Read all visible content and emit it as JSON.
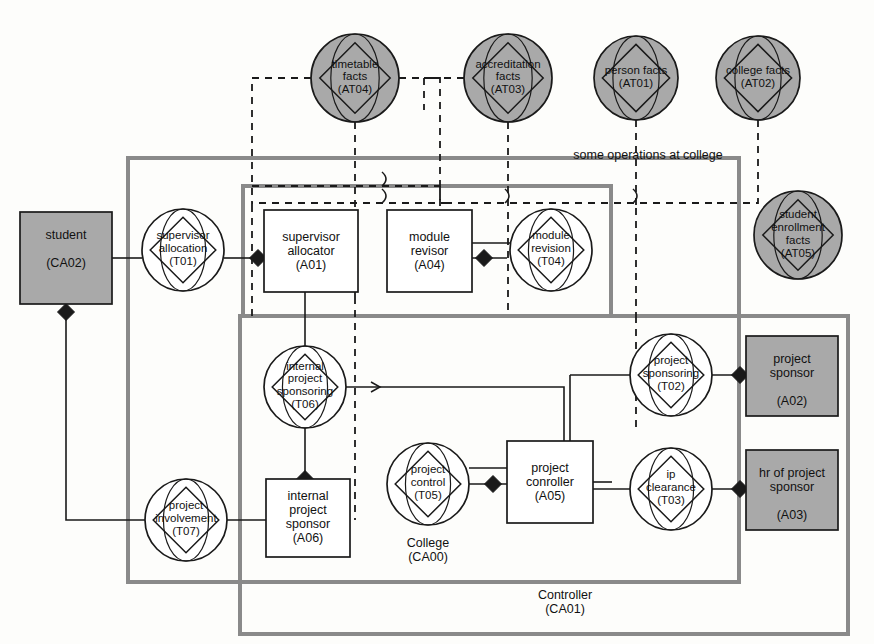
{
  "diagram": {
    "title_note": "some operations at college",
    "colors": {
      "gray_fill": "#a9a9a9",
      "white_fill": "#ffffff",
      "stroke": "#1a1a1a",
      "container_stroke": "#8a8a8a",
      "diamond_fill": "#1a1a1a"
    }
  },
  "fact_nodes": [
    {
      "id": "AT04",
      "name": "timetable\nfacts",
      "code": "(AT04)",
      "cx": 355,
      "cy": 78,
      "r": 44
    },
    {
      "id": "AT03",
      "name": "accreditation\nfacts",
      "code": "(AT03)",
      "cx": 508,
      "cy": 78,
      "r": 44
    },
    {
      "id": "AT01",
      "name": "person facts",
      "code": "(AT01)",
      "cx": 636,
      "cy": 78,
      "r": 42
    },
    {
      "id": "AT02",
      "name": "college facts",
      "code": "(AT02)",
      "cx": 758,
      "cy": 78,
      "r": 42
    },
    {
      "id": "AT05",
      "name": "student\nenrollment\nfacts",
      "code": "(AT05)",
      "cx": 798,
      "cy": 235,
      "r": 44
    }
  ],
  "transaction_nodes": [
    {
      "id": "T01",
      "name": "supervisor\nallocation",
      "code": "(T01)",
      "cx": 183,
      "cy": 250,
      "r": 41
    },
    {
      "id": "T04",
      "name": "module\nrevision",
      "code": "(T04)",
      "cx": 551,
      "cy": 250,
      "r": 41
    },
    {
      "id": "T06",
      "name": "internal\nproject\nsponsoring",
      "code": "(T06)",
      "cx": 305,
      "cy": 387,
      "r": 41
    },
    {
      "id": "T02",
      "name": "project\nsponsoring",
      "code": "(T02)",
      "cx": 671,
      "cy": 375,
      "r": 41
    },
    {
      "id": "T05",
      "name": "project\ncontrol",
      "code": "(T05)",
      "cx": 428,
      "cy": 484,
      "r": 41
    },
    {
      "id": "T03",
      "name": "ip\nclearance",
      "code": "(T03)",
      "cx": 671,
      "cy": 489,
      "r": 41
    },
    {
      "id": "T07",
      "name": "project\ninvolvement",
      "code": "(T07)",
      "cx": 186,
      "cy": 520,
      "r": 41
    }
  ],
  "actor_boxes": [
    {
      "id": "CA02",
      "name": "student",
      "code": "(CA02)",
      "x": 20,
      "y": 212,
      "w": 92,
      "h": 92,
      "fill": "gray"
    },
    {
      "id": "A01",
      "name": "supervisor\nallocator",
      "code": "(A01)",
      "x": 264,
      "y": 210,
      "w": 94,
      "h": 82,
      "fill": "white"
    },
    {
      "id": "A04",
      "name": "module\nrevisor",
      "code": "(A04)",
      "x": 387,
      "y": 210,
      "w": 85,
      "h": 82,
      "fill": "white"
    },
    {
      "id": "A02",
      "name": "project\nsponsor",
      "code": "(A02)",
      "x": 746,
      "y": 336,
      "w": 92,
      "h": 80,
      "fill": "gray"
    },
    {
      "id": "A03",
      "name": "hr of project\nsponsor",
      "code": "(A03)",
      "x": 746,
      "y": 450,
      "w": 92,
      "h": 80,
      "fill": "gray"
    },
    {
      "id": "A05",
      "name": "project\nconroller",
      "code": "(A05)",
      "x": 507,
      "y": 441,
      "w": 86,
      "h": 82,
      "fill": "white"
    },
    {
      "id": "A06",
      "name": "internal\nproject\nsponsor",
      "code": "(A06)",
      "x": 266,
      "y": 479,
      "w": 84,
      "h": 78,
      "fill": "white"
    }
  ],
  "containers": [
    {
      "id": "CA00",
      "label": "College",
      "code": "(CA00)",
      "x": 128,
      "y": 158,
      "w": 611,
      "h": 424,
      "label_x": 428,
      "label_y": 536
    },
    {
      "id": "CA01",
      "label": "Controller",
      "code": "(CA01)",
      "x": 240,
      "y": 316,
      "w": 608,
      "h": 318,
      "label_x": 565,
      "label_y": 588
    },
    {
      "id": "BOX_OPS",
      "label": "",
      "code": "",
      "x": 243,
      "y": 186,
      "w": 368,
      "h": 130,
      "label_x": 0,
      "label_y": 0
    }
  ],
  "annotations": [
    {
      "text": "some operations at college",
      "x": 648,
      "y": 148
    }
  ]
}
